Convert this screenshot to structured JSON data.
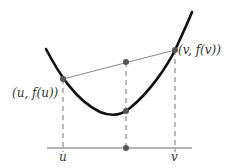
{
  "diagram": {
    "labels": {
      "point_u": "(u, f(u))",
      "point_v": "(v, f(v))",
      "axis_u": "u",
      "axis_v": "v"
    },
    "colors": {
      "curve": "#111111",
      "chord": "#888888",
      "dashed": "#777777",
      "axis": "#666666",
      "points": "#555555",
      "text": "#333333"
    }
  }
}
